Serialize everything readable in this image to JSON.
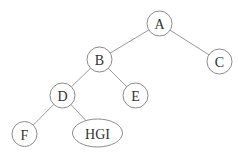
{
  "diagram": {
    "type": "binary-tree",
    "colors": {
      "edge": "#9a9a9a",
      "node_stroke": "#8c8c8c",
      "node_fill": "#ffffff",
      "label": "#333333",
      "background": "#ffffff"
    },
    "nodes": [
      {
        "id": "A",
        "label": "A",
        "shape": "circle",
        "cx": 159.5,
        "cy": 23.5,
        "r": 12.5
      },
      {
        "id": "B",
        "label": "B",
        "shape": "circle",
        "cx": 99.5,
        "cy": 59.5,
        "r": 12.5
      },
      {
        "id": "C",
        "label": "C",
        "shape": "circle",
        "cx": 219.5,
        "cy": 61.5,
        "r": 12.5
      },
      {
        "id": "D",
        "label": "D",
        "shape": "circle",
        "cx": 62.5,
        "cy": 95.5,
        "r": 12.5
      },
      {
        "id": "E",
        "label": "E",
        "shape": "circle",
        "cx": 135.5,
        "cy": 95.5,
        "r": 12.5
      },
      {
        "id": "F",
        "label": "F",
        "shape": "circle",
        "cx": 24.5,
        "cy": 134,
        "r": 12.5
      },
      {
        "id": "HGI",
        "label": "HGI",
        "shape": "ellipse",
        "cx": 97.5,
        "cy": 133,
        "rx": 25,
        "ry": 14
      }
    ],
    "edges": [
      {
        "from": "A",
        "to": "B"
      },
      {
        "from": "A",
        "to": "C"
      },
      {
        "from": "B",
        "to": "D"
      },
      {
        "from": "B",
        "to": "E"
      },
      {
        "from": "D",
        "to": "F"
      },
      {
        "from": "D",
        "to": "HGI"
      }
    ]
  }
}
